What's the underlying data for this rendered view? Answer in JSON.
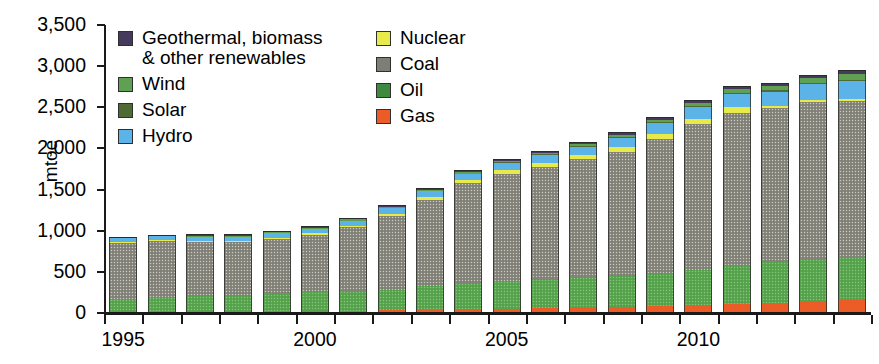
{
  "chart_data": {
    "type": "bar",
    "subtype": "stacked-bar",
    "title": "",
    "subtitle": "",
    "xlabel": "",
    "ylabel": "mtoe",
    "ylim": [
      0,
      3500
    ],
    "ytick_step": 500,
    "ytick_labels": [
      "3,500",
      "3,000",
      "2,500",
      "2,000",
      "1,500",
      "1,000",
      "500",
      "0"
    ],
    "ytick_values": [
      3500,
      3000,
      2500,
      2000,
      1500,
      1000,
      500,
      0
    ],
    "grid": false,
    "legend_position": "inside-top-left",
    "categories": [
      "1995",
      "1996",
      "1997",
      "1998",
      "1999",
      "2000",
      "2001",
      "2002",
      "2003",
      "2004",
      "2005",
      "2006",
      "2007",
      "2008",
      "2009",
      "2010",
      "2011",
      "2012",
      "2013",
      "2014"
    ],
    "xtick_labels_shown": [
      "1995",
      "2000",
      "2005",
      "2010"
    ],
    "xtick_label_categories": [
      "1995",
      "2000",
      "2005",
      "2010"
    ],
    "stack_order_bottom_to_top": [
      "Gas",
      "Oil",
      "Coal",
      "Nuclear",
      "Hydro",
      "Solar",
      "Wind",
      "Geothermal, biomass & other renewables"
    ],
    "series": [
      {
        "name": "Gas",
        "color": "#ec5c26",
        "values": [
          18,
          20,
          21,
          22,
          24,
          27,
          30,
          34,
          39,
          45,
          52,
          59,
          66,
          74,
          83,
          96,
          110,
          125,
          140,
          155
        ]
      },
      {
        "name": "Oil",
        "color": "#5aa84f",
        "values": [
          155,
          170,
          180,
          190,
          205,
          225,
          235,
          250,
          285,
          320,
          340,
          355,
          370,
          380,
          395,
          430,
          465,
          490,
          520,
          530
        ]
      },
      {
        "name": "Coal",
        "color": "#8a8a80",
        "values": [
          680,
          680,
          660,
          650,
          670,
          700,
          780,
          900,
          1055,
          1210,
          1300,
          1360,
          1430,
          1500,
          1640,
          1770,
          1860,
          1880,
          1900,
          1890
        ]
      },
      {
        "name": "Nuclear",
        "color": "#e8ea4a",
        "values": [
          12,
          14,
          14,
          14,
          15,
          16,
          17,
          25,
          33,
          40,
          45,
          48,
          52,
          58,
          62,
          65,
          68,
          22,
          25,
          30
        ]
      },
      {
        "name": "Hydro",
        "color": "#5cb3e8",
        "values": [
          45,
          48,
          50,
          53,
          56,
          58,
          62,
          70,
          75,
          80,
          85,
          95,
          105,
          120,
          130,
          145,
          160,
          175,
          195,
          215
        ]
      },
      {
        "name": "Solar",
        "color": "#4d6b33",
        "values": [
          0,
          0,
          0,
          0,
          0,
          0,
          0,
          0,
          0,
          0,
          1,
          1,
          2,
          3,
          4,
          5,
          7,
          10,
          14,
          18
        ]
      },
      {
        "name": "Wind",
        "color": "#5fa052",
        "values": [
          0,
          0,
          1,
          1,
          1,
          2,
          2,
          3,
          4,
          5,
          7,
          10,
          14,
          20,
          28,
          36,
          44,
          52,
          62,
          72
        ]
      },
      {
        "name": "Geothermal, biomass & other renewables",
        "color": "#453a5e",
        "values": [
          18,
          18,
          19,
          19,
          20,
          21,
          22,
          23,
          24,
          25,
          26,
          27,
          28,
          30,
          32,
          34,
          36,
          38,
          40,
          42
        ]
      }
    ],
    "totals": [
      928,
      950,
      945,
      949,
      991,
      1049,
      1148,
      1305,
      1515,
      1725,
      1856,
      1955,
      2067,
      2185,
      2374,
      2581,
      2750,
      2792,
      2896,
      2952
    ]
  },
  "legend": {
    "left_column": [
      {
        "label": "Geothermal, biomass\n& other renewables",
        "swatch_class": "sw-geo",
        "name": "geothermal"
      },
      {
        "label": "Wind",
        "swatch_class": "sw-wind",
        "name": "wind"
      },
      {
        "label": "Solar",
        "swatch_class": "sw-solar",
        "name": "solar"
      },
      {
        "label": "Hydro",
        "swatch_class": "sw-hydro",
        "name": "hydro"
      }
    ],
    "right_column": [
      {
        "label": "Nuclear",
        "swatch_class": "sw-nuclear",
        "name": "nuclear"
      },
      {
        "label": "Coal",
        "swatch_class": "sw-coal",
        "name": "coal"
      },
      {
        "label": "Oil",
        "swatch_class": "sw-oil",
        "name": "oil"
      },
      {
        "label": "Gas",
        "swatch_class": "sw-gas",
        "name": "gas"
      }
    ]
  },
  "colors": {
    "geothermal": "#453a5e",
    "wind": "#5fa052",
    "solar": "#4d6b33",
    "hydro": "#5cb3e8",
    "nuclear": "#e8ea4a",
    "coal": "#8a8a80",
    "oil": "#5aa84f",
    "gas": "#ec5c26",
    "axis": "#1a1a1a",
    "background": "#ffffff"
  }
}
